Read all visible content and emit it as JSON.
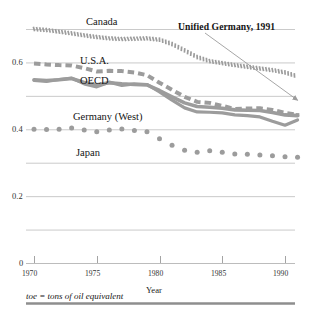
{
  "chart_data": {
    "type": "line",
    "title": "",
    "subtitle": "",
    "xlabel": "Year",
    "ylabel": "",
    "footnote": "toe = tons of oil equivalent",
    "grid": true,
    "legend_position": "inline-labels",
    "xlim": [
      1969.3,
      1991.6
    ],
    "ylim": [
      0,
      0.7
    ],
    "xticks": [
      1970,
      1975,
      1980,
      1985,
      1990
    ],
    "xticklabels": [
      "1970",
      "1975",
      "1980",
      "1985",
      "1990"
    ],
    "yticks": [
      0,
      0.1,
      0.2,
      0.3,
      0.4,
      0.5,
      0.6,
      0.7
    ],
    "yticklabels": [
      "0",
      "",
      "0.2",
      "",
      "0.4",
      "",
      "0.6",
      ""
    ],
    "annotations": [
      {
        "text": "Unified Germany, 1991",
        "points_to_year": 1991,
        "points_to_value": 0.487
      }
    ],
    "x": [
      1970,
      1971,
      1972,
      1973,
      1974,
      1975,
      1976,
      1977,
      1978,
      1979,
      1980,
      1981,
      1982,
      1983,
      1984,
      1985,
      1986,
      1987,
      1988,
      1989,
      1990,
      1991
    ],
    "series": [
      {
        "name": "Canada",
        "style": "hatched-ticks",
        "color": "#9c9c9c",
        "values": [
          0.7,
          0.697,
          0.692,
          0.687,
          0.681,
          0.676,
          0.672,
          0.67,
          0.671,
          0.672,
          0.668,
          0.655,
          0.636,
          0.616,
          0.604,
          0.598,
          0.592,
          0.587,
          0.582,
          0.577,
          0.57,
          0.558
        ]
      },
      {
        "name": "U.S.A.",
        "style": "thick-dash",
        "color": "#9c9c9c",
        "values": [
          0.597,
          0.594,
          0.592,
          0.591,
          0.583,
          0.573,
          0.575,
          0.574,
          0.57,
          0.562,
          0.539,
          0.518,
          0.497,
          0.482,
          0.479,
          0.47,
          0.461,
          0.462,
          0.463,
          0.458,
          0.449,
          0.443
        ]
      },
      {
        "name": "OECD",
        "style": "thick-solid",
        "color": "#9c9c9c",
        "values": [
          0.548,
          0.546,
          0.548,
          0.552,
          0.54,
          0.533,
          0.539,
          0.536,
          0.534,
          0.533,
          0.516,
          0.497,
          0.479,
          0.468,
          0.466,
          0.463,
          0.458,
          0.457,
          0.456,
          0.45,
          0.443,
          0.441
        ]
      },
      {
        "name": "Germany (West)",
        "style": "thick-solid",
        "color": "#9c9c9c",
        "values": [
          0.546,
          0.543,
          0.549,
          0.553,
          0.536,
          0.527,
          0.541,
          0.531,
          0.536,
          0.534,
          0.512,
          0.487,
          0.464,
          0.452,
          0.451,
          0.449,
          0.443,
          0.441,
          0.437,
          0.424,
          0.412,
          0.428
        ]
      },
      {
        "name": "Japan",
        "style": "round-dots",
        "color": "#9c9c9c",
        "values": [
          0.4,
          0.399,
          0.4,
          0.404,
          0.398,
          0.393,
          0.398,
          0.401,
          0.396,
          0.393,
          0.372,
          0.352,
          0.337,
          0.331,
          0.336,
          0.331,
          0.326,
          0.325,
          0.323,
          0.321,
          0.318,
          0.316
        ]
      }
    ]
  },
  "labels": {
    "canada": "Canada",
    "usa": "U.S.A.",
    "oecd": "OECD",
    "germany_west": "Germany (West)",
    "japan": "Japan",
    "annotation": "Unified Germany, 1991",
    "axis_x_title": "Year",
    "footnote": "toe = tons of oil equivalent"
  },
  "axis": {
    "y_0": "0",
    "y_02": "0.2",
    "y_04": "0.4",
    "y_06": "0.6",
    "x_1970": "1970",
    "x_1975": "1975",
    "x_1980": "1980",
    "x_1985": "1985",
    "x_1990": "1990"
  },
  "colors": {
    "line": "#9c9c9c",
    "grid": "#bcbcbc",
    "axis": "#9a9a9a",
    "text": "#141414",
    "rule": "#8e8e8e"
  }
}
